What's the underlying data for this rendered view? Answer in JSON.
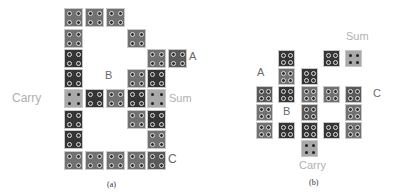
{
  "colors": {
    "light": "#a9a9a9",
    "mid": "#717171",
    "midDark": "#5a5a5a",
    "dark": "#353535",
    "labelDark": "#6a6a6a",
    "labelLight": "#b0b0b0"
  },
  "diagram_a": {
    "caption": "(a)",
    "cell_size": 19,
    "cells": [
      {
        "x": 64,
        "y": 8,
        "tone": "mid"
      },
      {
        "x": 85,
        "y": 8,
        "tone": "mid"
      },
      {
        "x": 106,
        "y": 8,
        "tone": "mid"
      },
      {
        "x": 64,
        "y": 29,
        "tone": "mid"
      },
      {
        "x": 127,
        "y": 29,
        "tone": "mid"
      },
      {
        "x": 64,
        "y": 49,
        "tone": "dark"
      },
      {
        "x": 147,
        "y": 49,
        "tone": "mid"
      },
      {
        "x": 168,
        "y": 49,
        "tone": "midDark"
      },
      {
        "x": 64,
        "y": 69,
        "tone": "dark"
      },
      {
        "x": 127,
        "y": 69,
        "tone": "mid"
      },
      {
        "x": 147,
        "y": 69,
        "tone": "dark"
      },
      {
        "x": 64,
        "y": 89,
        "tone": "light"
      },
      {
        "x": 85,
        "y": 89,
        "tone": "dark"
      },
      {
        "x": 106,
        "y": 89,
        "tone": "mid"
      },
      {
        "x": 127,
        "y": 89,
        "tone": "dark"
      },
      {
        "x": 147,
        "y": 89,
        "tone": "light"
      },
      {
        "x": 64,
        "y": 110,
        "tone": "dark"
      },
      {
        "x": 127,
        "y": 110,
        "tone": "mid"
      },
      {
        "x": 147,
        "y": 110,
        "tone": "dark"
      },
      {
        "x": 64,
        "y": 130,
        "tone": "dark"
      },
      {
        "x": 147,
        "y": 130,
        "tone": "mid"
      },
      {
        "x": 64,
        "y": 151,
        "tone": "mid"
      },
      {
        "x": 85,
        "y": 151,
        "tone": "mid"
      },
      {
        "x": 106,
        "y": 151,
        "tone": "mid"
      },
      {
        "x": 127,
        "y": 151,
        "tone": "mid"
      },
      {
        "x": 147,
        "y": 151,
        "tone": "midDark"
      }
    ],
    "labels": {
      "A": "A",
      "B": "B",
      "C": "C",
      "Carry": "Carry",
      "Sum": "Sum"
    }
  },
  "diagram_b": {
    "caption": "(b)",
    "cell_size": 17,
    "cells": [
      {
        "x": 278,
        "y": 50,
        "tone": "dark"
      },
      {
        "x": 323,
        "y": 50,
        "tone": "dark"
      },
      {
        "x": 345,
        "y": 50,
        "tone": "light"
      },
      {
        "x": 278,
        "y": 68,
        "tone": "mid"
      },
      {
        "x": 301,
        "y": 68,
        "tone": "dark"
      },
      {
        "x": 256,
        "y": 86,
        "tone": "midDark"
      },
      {
        "x": 278,
        "y": 86,
        "tone": "dark"
      },
      {
        "x": 301,
        "y": 86,
        "tone": "mid"
      },
      {
        "x": 323,
        "y": 86,
        "tone": "mid"
      },
      {
        "x": 345,
        "y": 86,
        "tone": "midDark"
      },
      {
        "x": 256,
        "y": 104,
        "tone": "mid"
      },
      {
        "x": 301,
        "y": 104,
        "tone": "midDark"
      },
      {
        "x": 345,
        "y": 104,
        "tone": "mid"
      },
      {
        "x": 256,
        "y": 122,
        "tone": "mid"
      },
      {
        "x": 278,
        "y": 122,
        "tone": "dark"
      },
      {
        "x": 301,
        "y": 122,
        "tone": "dark"
      },
      {
        "x": 323,
        "y": 122,
        "tone": "dark"
      },
      {
        "x": 345,
        "y": 122,
        "tone": "mid"
      },
      {
        "x": 301,
        "y": 140,
        "tone": "light"
      }
    ],
    "labels": {
      "A": "A",
      "B": "B",
      "C": "C",
      "Carry": "Carry",
      "Sum": "Sum"
    }
  }
}
